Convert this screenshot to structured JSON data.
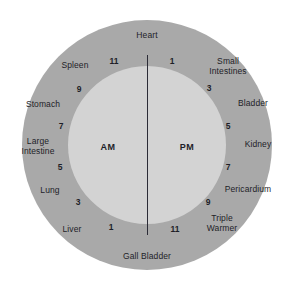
{
  "diagram": {
    "colors": {
      "outer_ring": "#a9a9a9",
      "inner_disc": "#d3d3d3",
      "divider": "#2b2b36",
      "text": "#1e1e28",
      "background": "#ffffff"
    },
    "center": {
      "am_label": "AM",
      "pm_label": "PM"
    },
    "organs": [
      {
        "name": "Heart",
        "x": 147,
        "y": 36,
        "lines": [
          "Heart"
        ]
      },
      {
        "name": "Small Intestines",
        "x": 228,
        "y": 67,
        "lines": [
          "Small",
          "Intestines"
        ]
      },
      {
        "name": "Bladder",
        "x": 253,
        "y": 104,
        "lines": [
          "Bladder"
        ]
      },
      {
        "name": "Kidney",
        "x": 258,
        "y": 145,
        "lines": [
          "Kidney"
        ]
      },
      {
        "name": "Pericardium",
        "x": 248,
        "y": 190,
        "lines": [
          "Pericardium"
        ]
      },
      {
        "name": "Triple Warmer",
        "x": 222,
        "y": 224,
        "lines": [
          "Triple",
          "Warmer"
        ]
      },
      {
        "name": "Gall Bladder",
        "x": 147,
        "y": 257,
        "lines": [
          "Gall Bladder"
        ]
      },
      {
        "name": "Liver",
        "x": 72,
        "y": 230,
        "lines": [
          "Liver"
        ]
      },
      {
        "name": "Lung",
        "x": 50,
        "y": 191,
        "lines": [
          "Lung"
        ]
      },
      {
        "name": "Large Intestine",
        "x": 38,
        "y": 147,
        "lines": [
          "Large",
          "Intestine"
        ]
      },
      {
        "name": "Stomach",
        "x": 43,
        "y": 105,
        "lines": [
          "Stomach"
        ]
      },
      {
        "name": "Spleen",
        "x": 75,
        "y": 66,
        "lines": [
          "Spleen"
        ]
      }
    ],
    "hours": [
      {
        "value": "1",
        "side": "pm",
        "x": 172,
        "y": 62
      },
      {
        "value": "3",
        "side": "pm",
        "x": 209,
        "y": 89
      },
      {
        "value": "5",
        "side": "pm",
        "x": 228,
        "y": 127
      },
      {
        "value": "7",
        "side": "pm",
        "x": 228,
        "y": 168
      },
      {
        "value": "9",
        "side": "pm",
        "x": 208,
        "y": 203
      },
      {
        "value": "11",
        "side": "pm",
        "x": 175,
        "y": 230
      },
      {
        "value": "1",
        "side": "am",
        "x": 111,
        "y": 228
      },
      {
        "value": "3",
        "side": "am",
        "x": 78,
        "y": 203
      },
      {
        "value": "5",
        "side": "am",
        "x": 60,
        "y": 168
      },
      {
        "value": "7",
        "side": "am",
        "x": 61,
        "y": 127
      },
      {
        "value": "9",
        "side": "am",
        "x": 79,
        "y": 90
      },
      {
        "value": "11",
        "side": "am",
        "x": 114,
        "y": 62
      }
    ]
  }
}
